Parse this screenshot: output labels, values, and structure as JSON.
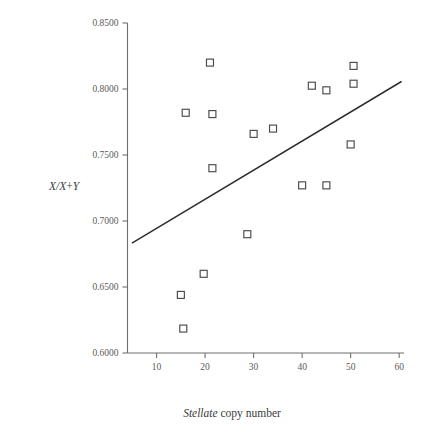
{
  "chart_data": {
    "type": "scatter",
    "title": "",
    "xlabel": "Stellate copy number",
    "xlabel_italic_part": "Stellate",
    "xlabel_roman_part": "copy number",
    "ylabel": "X/X+Y",
    "xlim": [
      4,
      61
    ],
    "ylim": [
      0.6,
      0.85
    ],
    "xticks": [
      10,
      20,
      30,
      40,
      50,
      60
    ],
    "xtick_labels": [
      "10",
      "20",
      "30",
      "40",
      "50",
      "60"
    ],
    "yticks": [
      0.6,
      0.65,
      0.7,
      0.75,
      0.8,
      0.85
    ],
    "ytick_labels": [
      "0.6000",
      "0.6500",
      "0.7000",
      "0.7500",
      "0.8000",
      "0.8500"
    ],
    "grid": false,
    "legend": "none",
    "marker_style": "open-square",
    "points": [
      {
        "x": 15.0,
        "y": 0.644
      },
      {
        "x": 15.5,
        "y": 0.6185
      },
      {
        "x": 16.0,
        "y": 0.782
      },
      {
        "x": 19.7,
        "y": 0.66
      },
      {
        "x": 21.0,
        "y": 0.82
      },
      {
        "x": 21.5,
        "y": 0.781
      },
      {
        "x": 21.5,
        "y": 0.74
      },
      {
        "x": 28.7,
        "y": 0.69
      },
      {
        "x": 30.0,
        "y": 0.766
      },
      {
        "x": 34.0,
        "y": 0.77
      },
      {
        "x": 40.0,
        "y": 0.727
      },
      {
        "x": 42.0,
        "y": 0.8025
      },
      {
        "x": 45.0,
        "y": 0.799
      },
      {
        "x": 45.0,
        "y": 0.727
      },
      {
        "x": 50.0,
        "y": 0.758
      },
      {
        "x": 50.6,
        "y": 0.804
      },
      {
        "x": 50.6,
        "y": 0.8175
      }
    ],
    "trend_line": {
      "x_start": 5.0,
      "y_start": 0.6835,
      "x_end": 60.4,
      "y_end": 0.8055
    },
    "colors": {
      "marker_stroke": "#4a4a4a",
      "marker_fill": "#ffffff",
      "line": "#2e2e2e",
      "axis": "#6f6f6f",
      "text": "#3a3a3a"
    }
  }
}
